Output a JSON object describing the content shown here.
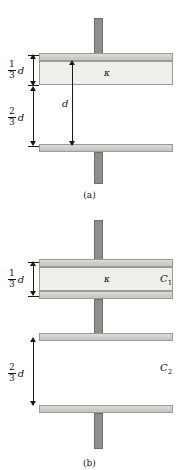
{
  "figure": {
    "type": "physics-diagram"
  },
  "panel_a": {
    "caption": "(a)",
    "dielectric_symbol": "κ",
    "gap_label": "d",
    "dim_top": {
      "numerator": "1",
      "denominator": "3",
      "variable": "d"
    },
    "dim_bottom": {
      "numerator": "2",
      "denominator": "3",
      "variable": "d"
    }
  },
  "panel_b": {
    "caption": "(b)",
    "dielectric_symbol": "κ",
    "capacitor_top_label": "C",
    "capacitor_top_sub": "1",
    "capacitor_bottom_label": "C",
    "capacitor_bottom_sub": "2",
    "dim_top": {
      "numerator": "1",
      "denominator": "3",
      "variable": "d"
    },
    "dim_bottom": {
      "numerator": "2",
      "denominator": "3",
      "variable": "d"
    }
  },
  "colors": {
    "plate_fill": "#d2d2cf",
    "plate_stroke": "#9a9a97",
    "stem_fill": "#8e8e8b",
    "dielectric_fill": "#eeeeea",
    "ink": "#111111"
  }
}
